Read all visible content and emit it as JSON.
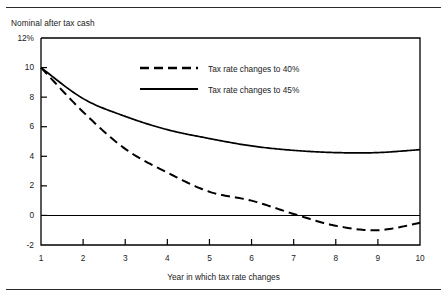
{
  "figure": {
    "y_axis_title": "Nominal after tax cash",
    "x_axis_title": "Year in which tax rate changes",
    "rule_color": "#2b2b2b",
    "line_color": "#000000"
  },
  "legend": {
    "entries": [
      {
        "label": "Tax rate changes to 40%",
        "style": "dashed"
      },
      {
        "label": "Tax rate changes to 45%",
        "style": "solid"
      }
    ]
  },
  "chart_data": {
    "type": "line",
    "title": "",
    "subtitle": "",
    "xlabel": "Year in which tax rate changes",
    "ylabel": "Nominal after tax cash",
    "x": [
      1,
      2,
      3,
      4,
      5,
      6,
      7,
      8,
      9,
      10
    ],
    "xtick_labels": [
      "1",
      "2",
      "3",
      "4",
      "5",
      "6",
      "7",
      "8",
      "9",
      "10"
    ],
    "ytick_labels": [
      "12%",
      "10",
      "8",
      "6",
      "4",
      "2",
      "0",
      "-2"
    ],
    "ytick_values": [
      12,
      10,
      8,
      6,
      4,
      2,
      0,
      -2
    ],
    "xlim": [
      1,
      10
    ],
    "ylim": [
      -2,
      12
    ],
    "grid": false,
    "zero_line": true,
    "legend_position": "inside-top-center",
    "series": [
      {
        "name": "Tax rate changes to 40%",
        "style": "dashed",
        "values": [
          10.0,
          7.9,
          6.7,
          5.8,
          5.2,
          4.7,
          4.4,
          4.25,
          4.25,
          4.45
        ]
      },
      {
        "name": "Tax rate changes to 45%",
        "style": "solid",
        "values": [
          10.0,
          7.0,
          4.5,
          2.9,
          1.6,
          1.0,
          0.1,
          -0.7,
          -1.0,
          -0.5
        ]
      }
    ]
  }
}
